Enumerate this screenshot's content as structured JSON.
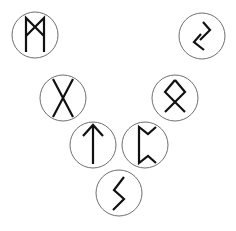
{
  "diagram": {
    "layout": "V-shaped arrangement of seven circled runes",
    "ring_color": "#6e6e6e",
    "glyph_color": "#111111",
    "background": "#ffffff",
    "runes": [
      {
        "name": "Mannaz",
        "glyph": "ᛗ",
        "cx": 35,
        "cy": 35,
        "r": 23
      },
      {
        "name": "Jera",
        "glyph": "ᛃ",
        "cx": 202,
        "cy": 36,
        "r": 23
      },
      {
        "name": "Gebo",
        "glyph": "ᚷ",
        "cx": 63,
        "cy": 98,
        "r": 23
      },
      {
        "name": "Othala",
        "glyph": "ᛟ",
        "cx": 175,
        "cy": 98,
        "r": 23
      },
      {
        "name": "Tiwaz",
        "glyph": "ᛏ",
        "cx": 93,
        "cy": 145,
        "r": 23
      },
      {
        "name": "Perthro",
        "glyph": "ᛈ",
        "cx": 145,
        "cy": 145,
        "r": 23
      },
      {
        "name": "Sowilo",
        "glyph": "ᛊ",
        "cx": 119,
        "cy": 193,
        "r": 23
      }
    ]
  }
}
